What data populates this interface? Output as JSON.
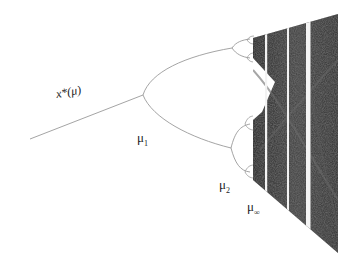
{
  "diagram": {
    "type": "bifurcation-diagram",
    "labels": {
      "fixed_point": "x*(μ)",
      "mu1": {
        "symbol": "μ",
        "subscript": "1"
      },
      "mu2": {
        "symbol": "μ",
        "subscript": "2"
      },
      "mu_inf": {
        "symbol": "μ",
        "subscript": "∞"
      }
    },
    "colors": {
      "branch": "#9a9a9a",
      "chaos_dark": "#2a2a2a",
      "chaos_mid": "#555555",
      "window": "#f2f2f2",
      "text": "#222222"
    }
  }
}
